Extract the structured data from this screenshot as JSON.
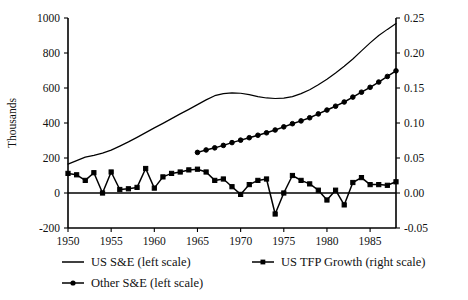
{
  "chart_data": {
    "type": "line",
    "title": "",
    "subtitle": "",
    "xlabel": "",
    "ylabel": "Thousands",
    "y2label": "",
    "grid": false,
    "legend_position": "bottom",
    "xlim": [
      1950,
      1988
    ],
    "ylim": [
      -200,
      1000
    ],
    "y2lim": [
      -0.05,
      0.25
    ],
    "x_ticks": [
      1950,
      1955,
      1960,
      1965,
      1970,
      1975,
      1980,
      1985
    ],
    "x_tick_labels": [
      "1950",
      "1955",
      "1960",
      "1965",
      "1970",
      "1975",
      "1980",
      "1985"
    ],
    "y_ticks": [
      -200,
      0,
      200,
      400,
      600,
      800,
      1000
    ],
    "y_tick_labels": [
      "-200",
      "0",
      "200",
      "400",
      "600",
      "800",
      "1000"
    ],
    "y2_ticks": [
      -0.05,
      0.0,
      0.05,
      0.1,
      0.15,
      0.2,
      0.25
    ],
    "y2_tick_labels": [
      "-0.05",
      "0.00",
      "0.05",
      "0.10",
      "0.15",
      "0.20",
      "0.25"
    ],
    "series": [
      {
        "name": "US S&E (left scale)",
        "axis": "left",
        "marker": "none",
        "x": [
          1950,
          1951,
          1952,
          1953,
          1954,
          1955,
          1956,
          1957,
          1958,
          1959,
          1960,
          1961,
          1962,
          1963,
          1964,
          1965,
          1966,
          1967,
          1968,
          1969,
          1970,
          1971,
          1972,
          1973,
          1974,
          1975,
          1976,
          1977,
          1978,
          1979,
          1980,
          1981,
          1982,
          1983,
          1984,
          1985,
          1986,
          1987,
          1988
        ],
        "values": [
          165,
          185,
          205,
          215,
          228,
          245,
          268,
          292,
          318,
          345,
          372,
          398,
          425,
          452,
          478,
          505,
          532,
          556,
          568,
          572,
          570,
          562,
          551,
          543,
          540,
          542,
          551,
          568,
          590,
          618,
          650,
          686,
          724,
          766,
          812,
          858,
          900,
          935,
          968
        ]
      },
      {
        "name": "Other S&E (left scale)",
        "axis": "left",
        "marker": "circle",
        "x": [
          1965,
          1966,
          1967,
          1968,
          1969,
          1970,
          1971,
          1972,
          1973,
          1974,
          1975,
          1976,
          1977,
          1978,
          1979,
          1980,
          1981,
          1982,
          1983,
          1984,
          1985,
          1986,
          1987,
          1988
        ],
        "values": [
          232,
          246,
          258,
          272,
          288,
          302,
          316,
          330,
          344,
          360,
          378,
          396,
          412,
          430,
          452,
          474,
          496,
          520,
          548,
          576,
          604,
          634,
          666,
          698
        ]
      },
      {
        "name": "US TFP Growth (right scale)",
        "axis": "right",
        "marker": "square",
        "x": [
          1950,
          1951,
          1952,
          1953,
          1954,
          1955,
          1956,
          1957,
          1958,
          1959,
          1960,
          1961,
          1962,
          1963,
          1964,
          1965,
          1966,
          1967,
          1968,
          1969,
          1970,
          1971,
          1972,
          1973,
          1974,
          1975,
          1976,
          1977,
          1978,
          1979,
          1980,
          1981,
          1982,
          1983,
          1984,
          1985,
          1986,
          1987,
          1988
        ],
        "values": [
          0.028,
          0.026,
          0.018,
          0.029,
          0.0,
          0.03,
          0.005,
          0.006,
          0.008,
          0.035,
          0.007,
          0.023,
          0.028,
          0.03,
          0.033,
          0.034,
          0.03,
          0.018,
          0.02,
          0.009,
          -0.002,
          0.012,
          0.018,
          0.02,
          -0.03,
          0.0,
          0.025,
          0.018,
          0.013,
          0.004,
          -0.01,
          0.004,
          -0.017,
          0.015,
          0.022,
          0.012,
          0.012,
          0.011,
          0.016
        ]
      }
    ]
  },
  "legend": {
    "entries": [
      {
        "label": "US S&E (left scale)",
        "marker": "line"
      },
      {
        "label": "US TFP Growth (right scale)",
        "marker": "line-square"
      },
      {
        "label": "Other S&E (left scale)",
        "marker": "line-circle"
      }
    ]
  },
  "colors": {
    "series": "#000000",
    "axis": "#000000",
    "background": "#ffffff"
  }
}
